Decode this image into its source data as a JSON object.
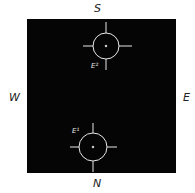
{
  "diagram": {
    "compass": {
      "top": "S",
      "bottom": "N",
      "left": "W",
      "right": "E"
    },
    "field": {
      "background": "#050505",
      "line_color": "#e8e8e8"
    },
    "markers": [
      {
        "id": "upper",
        "label": "E²",
        "cx": 106,
        "cy": 46,
        "r": 13
      },
      {
        "id": "lower",
        "label": "E¹",
        "cx": 93,
        "cy": 147,
        "r": 14
      }
    ]
  }
}
